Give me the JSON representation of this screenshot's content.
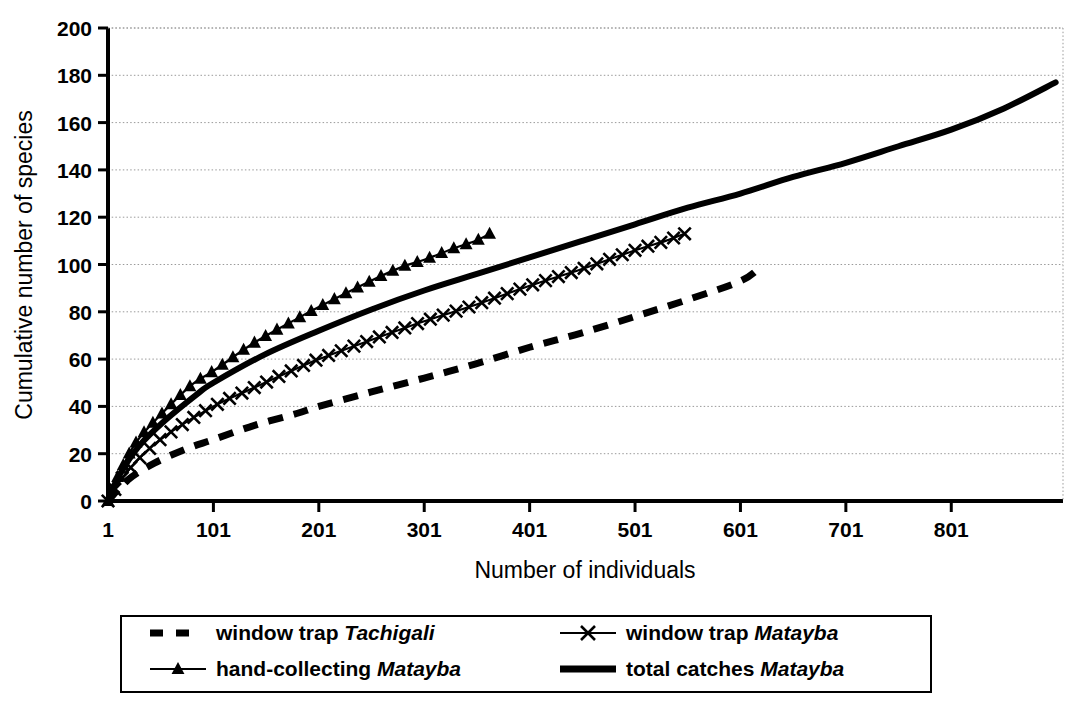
{
  "chart_data": {
    "type": "line",
    "title": "",
    "xlabel": "Number of individuals",
    "ylabel": "Cumulative number of species",
    "xlim": [
      1,
      907
    ],
    "ylim": [
      0,
      200
    ],
    "xticks": [
      1,
      101,
      201,
      301,
      401,
      501,
      601,
      701,
      801
    ],
    "yticks": [
      0,
      20,
      40,
      60,
      80,
      100,
      120,
      140,
      160,
      180,
      200
    ],
    "grid": "horizontal-dotted",
    "legend_position": "bottom",
    "series": [
      {
        "name": "window trap Tachigali",
        "genus": "Tachigali",
        "prefix": "window trap ",
        "style": "dashed",
        "marker": "none",
        "color": "#000000",
        "x": [
          1,
          20,
          45,
          75,
          101,
          140,
          180,
          201,
          250,
          301,
          350,
          401,
          450,
          501,
          550,
          601,
          620
        ],
        "y": [
          0,
          9,
          16,
          22,
          26,
          32,
          37,
          40,
          46,
          52,
          58,
          65,
          71,
          78,
          85,
          93,
          99
        ]
      },
      {
        "name": "window trap Matayba",
        "genus": "Matayba",
        "prefix": "window trap ",
        "style": "solid-thin",
        "marker": "x",
        "color": "#000000",
        "x": [
          1,
          15,
          35,
          60,
          101,
          140,
          180,
          201,
          250,
          301,
          350,
          401,
          450,
          501,
          530,
          548
        ],
        "y": [
          0,
          10,
          20,
          29,
          40,
          48,
          56,
          60,
          68,
          76,
          83,
          91,
          98,
          106,
          110,
          113
        ]
      },
      {
        "name": "hand-collecting Matayba",
        "genus": "Matayba",
        "prefix": "hand-collecting ",
        "style": "solid-thin",
        "marker": "triangle",
        "color": "#000000",
        "x": [
          1,
          12,
          28,
          50,
          80,
          101,
          140,
          180,
          201,
          250,
          280,
          301,
          330,
          350,
          363
        ],
        "y": [
          0,
          12,
          25,
          36,
          49,
          55,
          67,
          77,
          82,
          93,
          99,
          102,
          107,
          110,
          113
        ]
      },
      {
        "name": "total catches Matayba",
        "genus": "Matayba",
        "prefix": "total catches ",
        "style": "solid-thick",
        "marker": "none",
        "color": "#000000",
        "x": [
          1,
          12,
          30,
          55,
          85,
          101,
          150,
          201,
          251,
          301,
          351,
          401,
          451,
          501,
          551,
          601,
          651,
          701,
          751,
          801,
          851,
          900
        ],
        "y": [
          0,
          11,
          23,
          34,
          45,
          50,
          62,
          72,
          81,
          89,
          96,
          103,
          110,
          117,
          124,
          130,
          137,
          143,
          150,
          157,
          166,
          177
        ]
      }
    ]
  },
  "axes": {
    "y_title": "Cumulative number of species",
    "x_title": "Number of individuals",
    "y_tick_labels": [
      "200",
      "180",
      "160",
      "140",
      "120",
      "100",
      "80",
      "60",
      "40",
      "20",
      "0"
    ],
    "x_tick_labels": [
      "1",
      "101",
      "201",
      "301",
      "401",
      "501",
      "601",
      "701",
      "801"
    ]
  },
  "legend": {
    "entries": [
      {
        "label": "window trap Tachigali",
        "prefix": "window trap ",
        "species": "Tachigali",
        "marker": "dashed-line"
      },
      {
        "label": "window trap Matayba",
        "prefix": "window trap ",
        "species": "Matayba",
        "marker": "line-with-x"
      },
      {
        "label": "hand-collecting Matayba",
        "prefix": "hand-collecting ",
        "species": "Matayba",
        "marker": "line-with-triangle"
      },
      {
        "label": "total catches Matayba",
        "prefix": "total catches ",
        "species": "Matayba",
        "marker": "thick-line"
      }
    ]
  }
}
